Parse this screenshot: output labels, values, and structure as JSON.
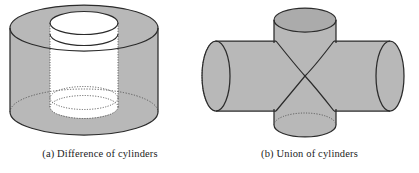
{
  "figure": {
    "background_color": "#ffffff",
    "surface_fill": "#b8b8b8",
    "surface_fill_dark": "#ababab",
    "hole_fill": "#ffffff",
    "outline_color": "#2b2b2b",
    "hidden_edge_color": "#5a5a5a"
  },
  "panels": [
    {
      "id": "difference-of-cylinders",
      "label": "(a) Difference of cylinders",
      "shape": "hollow-cylinder",
      "description": "Large shaded cylinder with a cylindrical bore removed through its axis"
    },
    {
      "id": "union-of-cylinders",
      "label": "(b) Union of cylinders",
      "shape": "cross-cylinders",
      "description": "Horizontal cylinder merged with a vertical cylinder forming a cross"
    }
  ]
}
